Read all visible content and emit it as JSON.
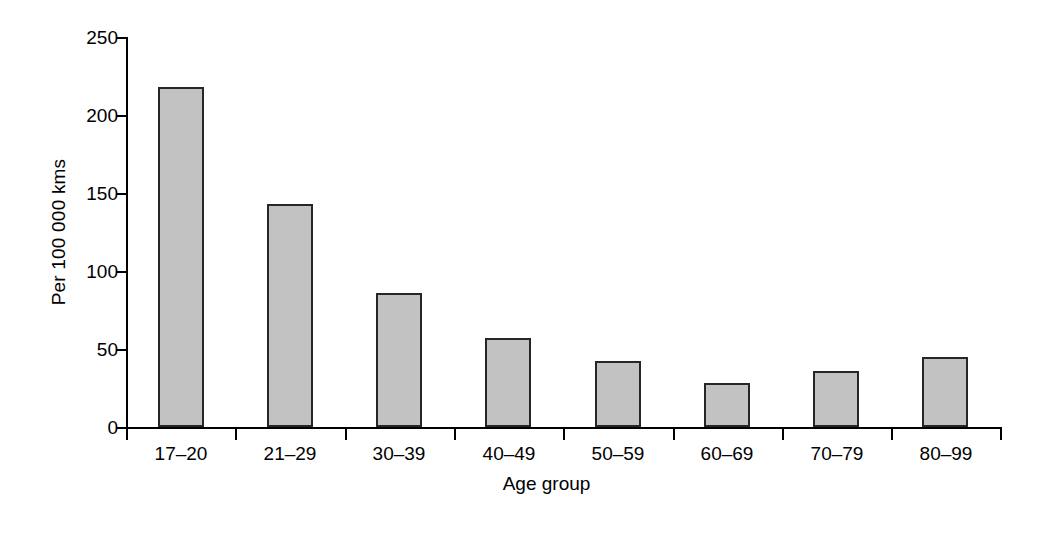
{
  "chart_data": {
    "type": "bar",
    "title": "",
    "subtitle": "",
    "xlabel": "Age group",
    "ylabel": "Per 100 000 kms",
    "categories": [
      "17–20",
      "21–29",
      "30–39",
      "40–49",
      "50–59",
      "60–69",
      "70–79",
      "80–99"
    ],
    "values": [
      218,
      143,
      86,
      57,
      42,
      28,
      36,
      45
    ],
    "ylim": [
      0,
      250
    ],
    "yticks": [
      0,
      50,
      100,
      150,
      200,
      250
    ],
    "ytick_labels": [
      "0",
      "50",
      "100",
      "150",
      "200",
      "250"
    ],
    "grid": false,
    "legend": null,
    "annotations": [],
    "colors": {
      "bar_fill": "#c2c2c2",
      "bar_stroke": "#262626",
      "axis": "#000000",
      "background": "#ffffff",
      "text": "#000000"
    }
  }
}
